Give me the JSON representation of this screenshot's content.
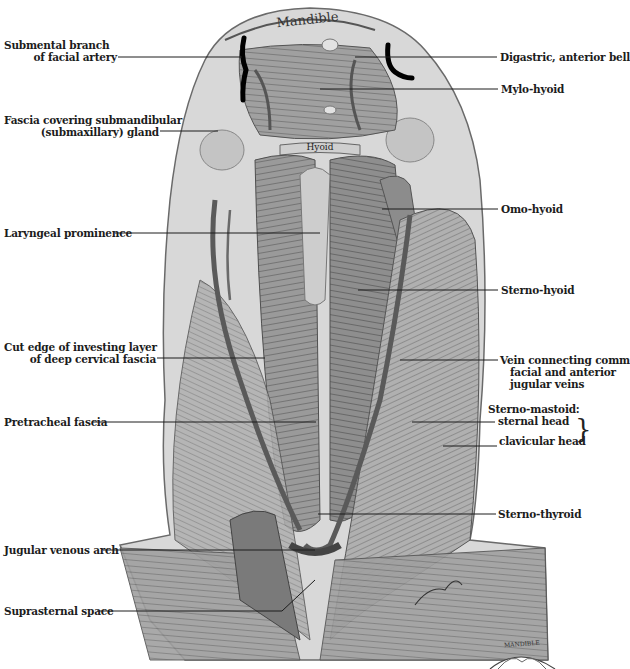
{
  "figure": {
    "structure_labels": {
      "mandible": "Mandible",
      "hyoid": "Hyoid",
      "inset_mandible": "MANDIBLE"
    },
    "left_labels": [
      {
        "id": "submental-branch",
        "line1": "Submental branch",
        "line2": "of facial artery"
      },
      {
        "id": "fascia-submandibular",
        "line1": "Fascia covering submandibular",
        "line2": "(submaxillary) gland"
      },
      {
        "id": "laryngeal-prominence",
        "line1": "Laryngeal prominence"
      },
      {
        "id": "cut-edge",
        "line1": "Cut edge of investing layer",
        "line2": "of deep cervical fascia"
      },
      {
        "id": "pretracheal-fascia",
        "line1": "Pretracheal fascia"
      },
      {
        "id": "jugular-venous-arch",
        "line1": "Jugular venous arch"
      },
      {
        "id": "suprasternal-space",
        "line1": "Suprasternal space"
      }
    ],
    "right_labels": [
      {
        "id": "digastric",
        "line1": "Digastric, anterior bell"
      },
      {
        "id": "mylo-hyoid",
        "line1": "Mylo-hyoid"
      },
      {
        "id": "omo-hyoid",
        "line1": "Omo-hyoid"
      },
      {
        "id": "sterno-hyoid",
        "line1": "Sterno-hyoid"
      },
      {
        "id": "vein-connecting",
        "line1": "Vein connecting comm",
        "line2": "facial and anterior",
        "line3": "jugular veins"
      },
      {
        "id": "sterno-mastoid",
        "line1": "Sterno-mastoid:",
        "line2": "sternal head",
        "line3": "clavicular head"
      },
      {
        "id": "sterno-thyroid",
        "line1": "Sterno-thyroid"
      }
    ],
    "colors": {
      "ink": "#1c1c1c",
      "skin": "#d9d9d9",
      "muscle": "#8a8a8a",
      "muscle_dark": "#5a5a5a",
      "marker": "#000000"
    }
  }
}
